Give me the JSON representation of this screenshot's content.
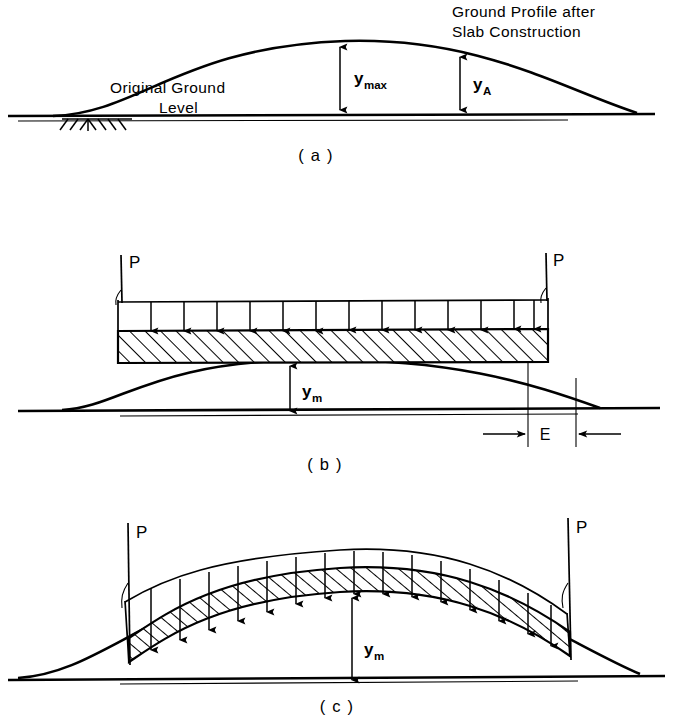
{
  "figure": {
    "background_color": "#ffffff",
    "line_color": "#000000"
  },
  "panels": [
    {
      "id": "a",
      "caption": "( a )",
      "annotations": [
        {
          "name": "ground-profile-note-line1",
          "text": "Ground  Profile  after"
        },
        {
          "name": "ground-profile-note-line2",
          "text": "Slab  Construction"
        },
        {
          "name": "original-ground-note-line1",
          "text": "Original Ground"
        },
        {
          "name": "original-ground-note-line2",
          "text": "Level"
        }
      ],
      "dimensions": [
        {
          "name": "y-max",
          "symbol": "y",
          "subscript": "max"
        },
        {
          "name": "y-a",
          "symbol": "y",
          "subscript": "A"
        }
      ]
    },
    {
      "id": "b",
      "caption": "( b )",
      "loads": [
        {
          "name": "load-P-left",
          "label": "P"
        },
        {
          "name": "load-P-right",
          "label": "P"
        }
      ],
      "distributed_load_arrow_count": 13,
      "dimensions": [
        {
          "name": "y-m",
          "symbol": "y",
          "subscript": "m"
        },
        {
          "name": "edge-gap-E",
          "symbol": "E",
          "subscript": ""
        }
      ]
    },
    {
      "id": "c",
      "caption": "( c )",
      "loads": [
        {
          "name": "load-P-left",
          "label": "P"
        },
        {
          "name": "load-P-right",
          "label": "P"
        }
      ],
      "distributed_load_arrow_count": 15,
      "dimensions": [
        {
          "name": "y-m",
          "symbol": "y",
          "subscript": "m"
        }
      ]
    }
  ]
}
